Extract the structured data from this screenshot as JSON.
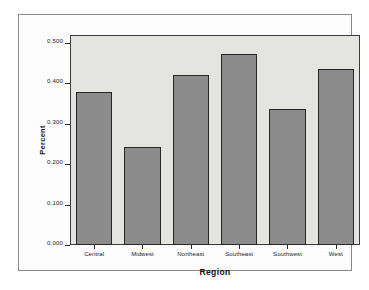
{
  "chart_data": {
    "type": "bar",
    "title": "",
    "subtitle": "",
    "xlabel": "Region",
    "ylabel": "Percent",
    "categories": [
      "Central",
      "Midwest",
      "Northeast",
      "Southeast",
      "Southwest",
      "West"
    ],
    "values": [
      0.378,
      0.242,
      0.42,
      0.474,
      0.336,
      0.436
    ],
    "ylim": [
      0.0,
      0.52
    ],
    "ytick_values": [
      0.0,
      0.1,
      0.2,
      0.3,
      0.4,
      0.5
    ],
    "ytick_labels": [
      "0.000",
      "0.100",
      "0.200",
      "0.300",
      "0.400",
      "0.500"
    ],
    "grid": false,
    "legend": null,
    "legend_position": "none",
    "annotations": []
  },
  "style": {
    "bar_fill": "#8c8c8c",
    "bar_border": "#262626",
    "plot_background": "#e4e4e0",
    "plot_border": "#3a3a3a",
    "frame_border": "#8a8a8a",
    "page_background": "#ffffff",
    "text_color": "#1a1a1a"
  }
}
